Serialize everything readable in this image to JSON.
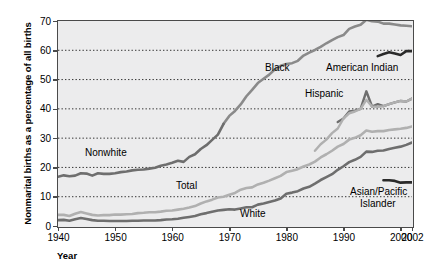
{
  "chart_data": {
    "type": "line",
    "title": "",
    "xlabel": "Year",
    "ylabel": "Nonmarital births as a percentage of all births",
    "xlim": [
      1940,
      2002
    ],
    "ylim": [
      0,
      70
    ],
    "grid": "horizontal-dotted",
    "legend_position": "inline-annotations",
    "y_ticks": [
      0,
      10,
      20,
      30,
      40,
      50,
      60,
      70
    ],
    "x_ticks": [
      1940,
      1950,
      1960,
      1970,
      1980,
      1990,
      2000,
      2002
    ],
    "x_tick_labels": [
      "1940",
      "1950",
      "1960",
      "1970",
      "1980",
      "1990",
      "2000",
      "2002"
    ],
    "y_tick_labels": [
      "0",
      "10",
      "20",
      "30",
      "40",
      "50",
      "60",
      "70"
    ],
    "series": [
      {
        "name": "Black",
        "color": "#8a8a8a",
        "width": 2.6,
        "x": [
          1969,
          1970,
          1971,
          1972,
          1973,
          1974,
          1975,
          1976,
          1977,
          1978,
          1979,
          1980,
          1981,
          1982,
          1983,
          1984,
          1985,
          1986,
          1987,
          1988,
          1989,
          1990,
          1991,
          1992,
          1993,
          1994,
          1995,
          1996,
          1997,
          1998,
          1999,
          2000,
          2001,
          2002
        ],
        "y": [
          34.9,
          37.6,
          39.3,
          41.5,
          44.3,
          46.5,
          48.8,
          50.3,
          51.7,
          53.5,
          54.7,
          55.3,
          55.6,
          56.4,
          58.2,
          59.2,
          60.1,
          61.2,
          62.4,
          63.5,
          64.5,
          65.2,
          67.3,
          68.1,
          68.7,
          70.4,
          69.9,
          69.8,
          69.1,
          69.1,
          68.8,
          68.5,
          68.4,
          68.2
        ]
      },
      {
        "name": "Nonwhite",
        "color": "#6e6e6e",
        "width": 2.6,
        "x": [
          1940,
          1941,
          1942,
          1943,
          1944,
          1945,
          1946,
          1947,
          1948,
          1949,
          1950,
          1951,
          1952,
          1953,
          1954,
          1955,
          1956,
          1957,
          1958,
          1959,
          1960,
          1961,
          1962,
          1963,
          1964,
          1965,
          1966,
          1967,
          1968,
          1969
        ],
        "y": [
          16.8,
          17.3,
          17.0,
          17.2,
          18.0,
          17.9,
          17.2,
          18.0,
          17.8,
          17.8,
          18.0,
          18.4,
          18.6,
          19.0,
          19.2,
          19.3,
          19.6,
          19.9,
          20.6,
          21.0,
          21.6,
          22.3,
          21.9,
          23.6,
          24.5,
          26.3,
          27.6,
          29.4,
          31.2,
          34.9
        ]
      },
      {
        "name": "Total",
        "color": "#b0b0b0",
        "width": 2.6,
        "x": [
          1940,
          1941,
          1942,
          1943,
          1944,
          1945,
          1946,
          1947,
          1948,
          1949,
          1950,
          1951,
          1952,
          1953,
          1954,
          1955,
          1956,
          1957,
          1958,
          1959,
          1960,
          1961,
          1962,
          1963,
          1964,
          1965,
          1966,
          1967,
          1968,
          1969,
          1970,
          1971,
          1972,
          1973,
          1974,
          1975,
          1976,
          1977,
          1978,
          1979,
          1980,
          1981,
          1982,
          1983,
          1984,
          1985,
          1986,
          1987,
          1988,
          1989,
          1990,
          1991,
          1992,
          1993,
          1994,
          1995,
          1996,
          1997,
          1998,
          1999,
          2000,
          2001,
          2002
        ],
        "y": [
          3.8,
          3.8,
          3.4,
          4.2,
          4.8,
          4.3,
          3.8,
          3.6,
          3.7,
          3.7,
          3.9,
          3.9,
          4.0,
          4.1,
          4.4,
          4.5,
          4.7,
          4.7,
          4.9,
          5.2,
          5.3,
          5.6,
          5.9,
          6.3,
          6.8,
          7.7,
          8.4,
          9.0,
          9.7,
          10.0,
          10.7,
          11.3,
          12.4,
          13.0,
          13.2,
          14.2,
          14.8,
          15.5,
          16.3,
          17.1,
          18.4,
          18.9,
          19.4,
          20.3,
          21.0,
          22.0,
          23.4,
          24.5,
          25.7,
          27.1,
          28.0,
          29.5,
          30.1,
          31.0,
          32.6,
          32.2,
          32.4,
          32.4,
          32.8,
          33.0,
          33.2,
          33.5,
          34.0
        ]
      },
      {
        "name": "White",
        "color": "#6e6e6e",
        "width": 2.6,
        "x": [
          1940,
          1941,
          1942,
          1943,
          1944,
          1945,
          1946,
          1947,
          1948,
          1949,
          1950,
          1951,
          1952,
          1953,
          1954,
          1955,
          1956,
          1957,
          1958,
          1959,
          1960,
          1961,
          1962,
          1963,
          1964,
          1965,
          1966,
          1967,
          1968,
          1969,
          1970,
          1971,
          1972,
          1973,
          1974,
          1975,
          1976,
          1977,
          1978,
          1979,
          1980,
          1981,
          1982,
          1983,
          1984,
          1985,
          1986,
          1987,
          1988,
          1989,
          1990,
          1991,
          1992,
          1993,
          1994,
          1995,
          1996,
          1997,
          1998,
          1999,
          2000,
          2001,
          2002
        ],
        "y": [
          2.0,
          2.1,
          1.8,
          2.3,
          2.7,
          2.4,
          2.0,
          1.8,
          1.8,
          1.7,
          1.7,
          1.7,
          1.7,
          1.8,
          1.8,
          1.9,
          1.9,
          1.9,
          2.0,
          2.2,
          2.3,
          2.5,
          2.8,
          3.1,
          3.4,
          4.0,
          4.4,
          4.9,
          5.3,
          5.5,
          5.7,
          5.6,
          6.0,
          6.4,
          6.4,
          7.3,
          7.7,
          8.2,
          8.7,
          9.4,
          11.0,
          11.4,
          11.9,
          12.8,
          13.4,
          14.5,
          15.7,
          16.7,
          17.7,
          19.2,
          20.4,
          21.8,
          22.6,
          23.6,
          25.4,
          25.3,
          25.7,
          25.8,
          26.3,
          26.7,
          27.1,
          27.7,
          28.5
        ]
      },
      {
        "name": "Hispanic",
        "color": "#6e6e6e",
        "width": 2.4,
        "x": [
          1989,
          1990,
          1991,
          1992,
          1993,
          1994,
          1995,
          1996,
          1997,
          1998,
          1999,
          2000,
          2001,
          2002
        ],
        "y": [
          35.5,
          36.7,
          39.1,
          39.4,
          40.0,
          46.0,
          40.8,
          41.6,
          40.9,
          41.6,
          42.2,
          42.7,
          42.5,
          43.5
        ]
      },
      {
        "name": "American Indian",
        "color": "#2a2a2a",
        "width": 2.6,
        "x": [
          1996,
          1997,
          1998,
          1999,
          2000,
          2001,
          2002
        ],
        "y": [
          58.0,
          58.7,
          59.3,
          58.9,
          58.4,
          59.7,
          59.7
        ]
      },
      {
        "name": "Asian/Pacific Islander",
        "color": "#2a2a2a",
        "width": 2.6,
        "x": [
          1997,
          1998,
          1999,
          2000,
          2001,
          2002
        ],
        "y": [
          15.6,
          15.6,
          15.4,
          14.8,
          14.9,
          14.9
        ]
      },
      {
        "name": "Hispanic-lower",
        "color": "#b0b0b0",
        "width": 2.4,
        "x": [
          1985,
          1986,
          1987,
          1988,
          1989,
          1990,
          1991,
          1992,
          1993,
          1994,
          1995,
          1996,
          1997,
          1998,
          1999,
          2000,
          2001,
          2002
        ],
        "y": [
          25.7,
          27.9,
          29.5,
          31.7,
          33.3,
          36.7,
          38.5,
          39.1,
          40.0,
          43.1,
          40.8,
          40.7,
          40.9,
          41.6,
          42.2,
          42.7,
          42.5,
          43.5
        ]
      }
    ],
    "annotations": [
      {
        "name": "black-label",
        "text": "Black",
        "x_px": 265,
        "y_px": 62
      },
      {
        "name": "american-indian-label",
        "text": "American Indian",
        "x_px": 326,
        "y_px": 62
      },
      {
        "name": "hispanic-label",
        "text": "Hispanic",
        "x_px": 305,
        "y_px": 88
      },
      {
        "name": "nonwhite-label",
        "text": "Nonwhite",
        "x_px": 85,
        "y_px": 147
      },
      {
        "name": "total-label",
        "text": "Total",
        "x_px": 176,
        "y_px": 180
      },
      {
        "name": "white-label",
        "text": "White",
        "x_px": 240,
        "y_px": 208
      },
      {
        "name": "asian-pacific-label-1",
        "text": "Asian/Pacific",
        "x_px": 350,
        "y_px": 186
      },
      {
        "name": "asian-pacific-label-2",
        "text": "Islander",
        "x_px": 360,
        "y_px": 198
      }
    ]
  },
  "axis": {
    "y_title": "Nonmarital births as a percentage of all births",
    "x_title": "Year"
  },
  "colors": {
    "plot_background": "#ececed",
    "frame": "#4a4a4a",
    "gridline": "#333333",
    "dark_series": "#2a2a2a",
    "mid_series": "#6e6e6e",
    "light_series": "#b0b0b0"
  }
}
